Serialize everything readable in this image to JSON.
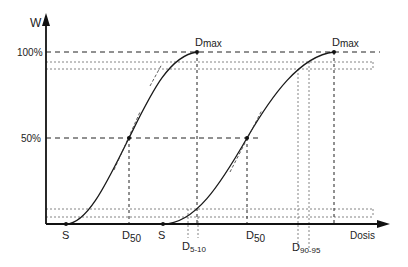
{
  "diagram": {
    "y_axis_label": "W",
    "x_axis_label": "Dosis",
    "y_ticks": [
      {
        "label": "100%",
        "y": 52
      },
      {
        "label": "50%",
        "y": 138
      }
    ],
    "curves": [
      {
        "name": "curve-1",
        "threshold_label": "S",
        "d50_label": "D",
        "d50_sub": "50",
        "dmax_label": "D",
        "dmax_sub": "max"
      },
      {
        "name": "curve-2",
        "threshold_label": "S",
        "d50_label": "D",
        "d50_sub": "50",
        "dmax_label": "D",
        "dmax_sub": "max"
      }
    ],
    "markers": {
      "d5_10_label": "D",
      "d5_10_sub": "5-10",
      "d90_95_label": "D",
      "d90_95_sub": "90-95"
    },
    "colors": {
      "line": "#1a1a1a",
      "dashed": "#333333",
      "dotted": "#555555"
    }
  }
}
